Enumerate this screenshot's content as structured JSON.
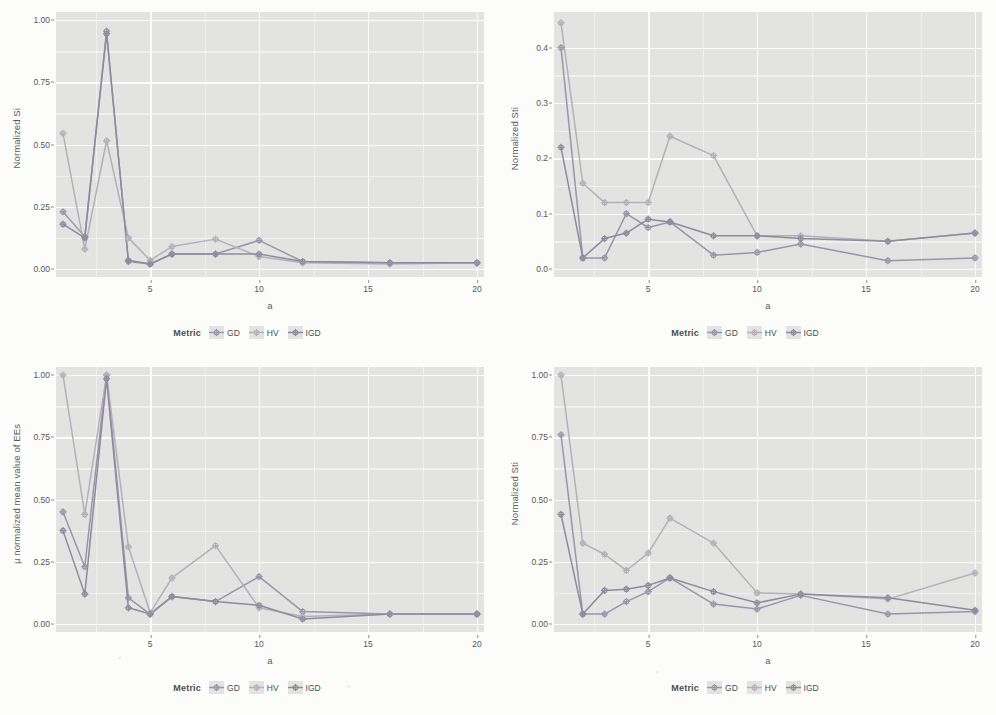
{
  "figure": {
    "layout": "2x2 grid of line charts",
    "series_colors": {
      "GD": "#9b95ab",
      "HV": "#b4b0bb",
      "IGD": "#8f8a9e"
    },
    "panel_background": "#e3e3e1",
    "gridline_color": "#fbfbfa"
  },
  "legend": {
    "title": "Metric",
    "items": [
      "GD",
      "HV",
      "IGD"
    ]
  },
  "chart_data": [
    {
      "id": "top-left",
      "type": "line",
      "title": "",
      "xlabel": "a",
      "ylabel": "Normalized Si",
      "xlim": [
        1,
        20
      ],
      "ylim": [
        0.0,
        1.0
      ],
      "xticks": [
        5,
        10,
        15,
        20
      ],
      "yticks": [
        0.0,
        0.25,
        0.5,
        0.75,
        1.0
      ],
      "ytick_labels": [
        "0.00",
        "0.25",
        "0.50",
        "0.75",
        "1.00"
      ],
      "grid": true,
      "legend_position": "bottom",
      "x": [
        1,
        2,
        3,
        4,
        5,
        6,
        8,
        10,
        12,
        16,
        20
      ],
      "series": [
        {
          "name": "GD",
          "values": [
            0.23,
            0.13,
            0.955,
            0.03,
            0.02,
            0.06,
            0.06,
            0.115,
            0.03,
            0.025,
            0.025
          ]
        },
        {
          "name": "HV",
          "values": [
            0.545,
            0.08,
            0.515,
            0.125,
            0.035,
            0.09,
            0.12,
            0.05,
            0.025,
            0.02,
            0.025
          ]
        },
        {
          "name": "IGD",
          "values": [
            0.18,
            0.125,
            0.945,
            0.035,
            0.02,
            0.06,
            0.06,
            0.06,
            0.03,
            0.025,
            0.025
          ]
        }
      ]
    },
    {
      "id": "top-right",
      "type": "line",
      "title": "",
      "xlabel": "a",
      "ylabel": "Normalized Sti",
      "xlim": [
        1,
        20
      ],
      "ylim": [
        0.0,
        0.45
      ],
      "xticks": [
        5,
        10,
        15,
        20
      ],
      "yticks": [
        0.0,
        0.1,
        0.2,
        0.3,
        0.4
      ],
      "ytick_labels": [
        "0.0",
        "0.1",
        "0.2",
        "0.3",
        "0.4"
      ],
      "grid": true,
      "legend_position": "bottom",
      "x": [
        1,
        2,
        3,
        4,
        5,
        6,
        8,
        10,
        12,
        16,
        20
      ],
      "series": [
        {
          "name": "GD",
          "values": [
            0.4,
            0.02,
            0.02,
            0.1,
            0.075,
            0.085,
            0.025,
            0.03,
            0.045,
            0.015,
            0.02
          ]
        },
        {
          "name": "HV",
          "values": [
            0.445,
            0.155,
            0.12,
            0.12,
            0.12,
            0.24,
            0.205,
            0.06,
            0.06,
            0.05,
            0.065
          ]
        },
        {
          "name": "IGD",
          "values": [
            0.22,
            0.02,
            0.055,
            0.065,
            0.09,
            0.085,
            0.06,
            0.06,
            0.055,
            0.05,
            0.065
          ]
        }
      ]
    },
    {
      "id": "bottom-left",
      "type": "line",
      "title": "",
      "xlabel": "a",
      "ylabel": "μ normalized mean value of EEs",
      "xlim": [
        1,
        20
      ],
      "ylim": [
        0.0,
        1.0
      ],
      "xticks": [
        5,
        10,
        15,
        20
      ],
      "yticks": [
        0.0,
        0.25,
        0.5,
        0.75,
        1.0
      ],
      "ytick_labels": [
        "0.00",
        "0.25",
        "0.50",
        "0.75",
        "1.00"
      ],
      "grid": true,
      "legend_position": "bottom",
      "x": [
        1,
        2,
        3,
        4,
        5,
        6,
        8,
        10,
        12,
        16,
        20
      ],
      "series": [
        {
          "name": "GD",
          "values": [
            0.45,
            0.23,
            1.0,
            0.105,
            0.04,
            0.11,
            0.09,
            0.19,
            0.05,
            0.04,
            0.04
          ]
        },
        {
          "name": "HV",
          "values": [
            1.0,
            0.44,
            1.0,
            0.31,
            0.045,
            0.185,
            0.315,
            0.065,
            0.03,
            0.04,
            0.04
          ]
        },
        {
          "name": "IGD",
          "values": [
            0.375,
            0.12,
            0.985,
            0.065,
            0.04,
            0.11,
            0.09,
            0.075,
            0.02,
            0.04,
            0.04
          ]
        }
      ]
    },
    {
      "id": "bottom-right",
      "type": "line",
      "title": "",
      "xlabel": "a",
      "ylabel": "Normalized Sti",
      "xlim": [
        1,
        20
      ],
      "ylim": [
        0.0,
        1.0
      ],
      "xticks": [
        5,
        10,
        15,
        20
      ],
      "yticks": [
        0.0,
        0.25,
        0.5,
        0.75,
        1.0
      ],
      "ytick_labels": [
        "0.00",
        "0.25",
        "0.50",
        "0.75",
        "1.00"
      ],
      "grid": true,
      "legend_position": "bottom",
      "x": [
        1,
        2,
        3,
        4,
        5,
        6,
        8,
        10,
        12,
        16,
        20
      ],
      "series": [
        {
          "name": "GD",
          "values": [
            0.76,
            0.04,
            0.04,
            0.09,
            0.13,
            0.185,
            0.08,
            0.06,
            0.115,
            0.04,
            0.05
          ]
        },
        {
          "name": "HV",
          "values": [
            1.0,
            0.325,
            0.28,
            0.215,
            0.285,
            0.425,
            0.325,
            0.125,
            0.12,
            0.1,
            0.205
          ]
        },
        {
          "name": "IGD",
          "values": [
            0.44,
            0.04,
            0.135,
            0.14,
            0.155,
            0.185,
            0.13,
            0.085,
            0.12,
            0.105,
            0.055
          ]
        }
      ]
    }
  ]
}
